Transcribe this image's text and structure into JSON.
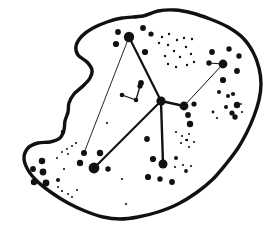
{
  "figure": {
    "canvas": {
      "width": 278,
      "height": 237,
      "background": "#ffffff",
      "ink": "#111111"
    },
    "outline": {
      "stroke_width": 3.4,
      "points": [
        [
          143,
          16
        ],
        [
          158,
          11
        ],
        [
          175,
          10
        ],
        [
          192,
          13
        ],
        [
          210,
          19
        ],
        [
          228,
          27
        ],
        [
          243,
          38
        ],
        [
          253,
          52
        ],
        [
          259,
          68
        ],
        [
          261,
          84
        ],
        [
          259,
          100
        ],
        [
          254,
          116
        ],
        [
          247,
          132
        ],
        [
          238,
          148
        ],
        [
          226,
          164
        ],
        [
          212,
          180
        ],
        [
          196,
          193
        ],
        [
          178,
          204
        ],
        [
          158,
          212
        ],
        [
          138,
          217
        ],
        [
          120,
          219
        ],
        [
          103,
          217
        ],
        [
          85,
          211
        ],
        [
          68,
          203
        ],
        [
          52,
          193
        ],
        [
          38,
          182
        ],
        [
          28,
          170
        ],
        [
          24,
          158
        ],
        [
          28,
          148
        ],
        [
          38,
          143
        ],
        [
          50,
          142
        ],
        [
          60,
          138
        ],
        [
          64,
          130
        ],
        [
          65,
          121
        ],
        [
          68,
          112
        ],
        [
          69,
          103
        ],
        [
          74,
          94
        ],
        [
          83,
          86
        ],
        [
          90,
          78
        ],
        [
          92,
          70
        ],
        [
          87,
          62
        ],
        [
          78,
          55
        ],
        [
          76,
          46
        ],
        [
          82,
          36
        ],
        [
          93,
          28
        ],
        [
          107,
          22
        ],
        [
          122,
          18
        ]
      ]
    },
    "edges": [
      {
        "x1": 129,
        "y1": 37,
        "x2": 161,
        "y2": 101,
        "w": 2.2
      },
      {
        "x1": 161,
        "y1": 101,
        "x2": 184,
        "y2": 106,
        "w": 2.4
      },
      {
        "x1": 161,
        "y1": 101,
        "x2": 163,
        "y2": 164,
        "w": 2.4
      },
      {
        "x1": 161,
        "y1": 101,
        "x2": 94,
        "y2": 168,
        "w": 2.2
      },
      {
        "x1": 184,
        "y1": 106,
        "x2": 223,
        "y2": 64,
        "w": 1.0
      },
      {
        "x1": 129,
        "y1": 37,
        "x2": 84,
        "y2": 153,
        "w": 0.9
      },
      {
        "x1": 223,
        "y1": 64,
        "x2": 209,
        "y2": 63,
        "w": 1.2
      },
      {
        "x1": 122,
        "y1": 95,
        "x2": 136,
        "y2": 100,
        "w": 1.3
      },
      {
        "x1": 140,
        "y1": 86,
        "x2": 136,
        "y2": 100,
        "w": 1.3
      }
    ],
    "hubs": [
      [
        129,
        37,
        5.2
      ],
      [
        223,
        64,
        4.4
      ],
      [
        161,
        101,
        4.6
      ],
      [
        184,
        106,
        4.4
      ],
      [
        94,
        168,
        5.4
      ],
      [
        163,
        164,
        4.5
      ]
    ],
    "dots": [
      [
        118,
        32,
        2.9
      ],
      [
        116,
        44,
        3.1
      ],
      [
        143,
        28,
        2.9
      ],
      [
        151,
        34,
        2.6
      ],
      [
        145,
        52,
        3.1
      ],
      [
        141,
        83,
        2.9
      ],
      [
        122,
        95,
        2.3
      ],
      [
        136,
        100,
        2.3
      ],
      [
        140,
        86,
        2.6
      ],
      [
        162,
        37,
        1.2
      ],
      [
        169,
        34,
        1.2
      ],
      [
        159,
        43,
        1.2
      ],
      [
        168,
        45,
        1.2
      ],
      [
        177,
        40,
        1.2
      ],
      [
        184,
        38,
        1.2
      ],
      [
        192,
        39,
        1.2
      ],
      [
        186,
        47,
        1.2
      ],
      [
        174,
        51,
        1.2
      ],
      [
        165,
        56,
        1.2
      ],
      [
        180,
        57,
        1.2
      ],
      [
        191,
        54,
        1.2
      ],
      [
        168,
        64,
        1.2
      ],
      [
        176,
        67,
        1.2
      ],
      [
        187,
        65,
        1.2
      ],
      [
        194,
        62,
        1.2
      ],
      [
        212,
        52,
        2.9
      ],
      [
        229,
        49,
        2.7
      ],
      [
        239,
        56,
        2.7
      ],
      [
        209,
        63,
        2.7
      ],
      [
        237,
        71,
        2.9
      ],
      [
        223,
        80,
        3.1
      ],
      [
        233,
        94,
        2.1
      ],
      [
        237,
        105,
        3.2
      ],
      [
        242,
        112,
        1.1
      ],
      [
        235,
        117,
        2.7
      ],
      [
        241,
        104,
        0.9
      ],
      [
        219,
        92,
        2.0
      ],
      [
        228,
        96,
        2.0
      ],
      [
        226,
        107,
        2.0
      ],
      [
        232,
        113,
        2.6
      ],
      [
        213,
        112,
        1.4
      ],
      [
        217,
        118,
        1.1
      ],
      [
        194,
        104,
        2.6
      ],
      [
        188,
        115,
        2.9
      ],
      [
        190,
        124,
        3.2
      ],
      [
        107,
        123,
        1.1
      ],
      [
        147,
        139,
        2.9
      ],
      [
        126,
        204,
        1.1
      ],
      [
        153,
        159,
        3.1
      ],
      [
        148,
        177,
        3.1
      ],
      [
        160,
        179,
        2.7
      ],
      [
        172,
        182,
        2.9
      ],
      [
        176,
        158,
        2.0
      ],
      [
        175,
        167,
        1.1
      ],
      [
        183,
        165,
        1.1
      ],
      [
        176,
        132,
        1.1
      ],
      [
        182,
        136,
        1.1
      ],
      [
        187,
        140,
        1.2
      ],
      [
        181,
        143,
        1.1
      ],
      [
        189,
        134,
        1.0
      ],
      [
        194,
        142,
        1.1
      ],
      [
        189,
        147,
        1.1
      ],
      [
        186,
        140,
        1.0
      ],
      [
        191,
        166,
        1.1
      ],
      [
        186,
        171,
        1.9
      ],
      [
        84,
        153,
        3.0
      ],
      [
        80,
        163,
        3.2
      ],
      [
        100,
        153,
        3.2
      ],
      [
        108,
        169,
        2.7
      ],
      [
        122,
        179,
        1.1
      ],
      [
        42,
        161,
        3.2
      ],
      [
        33,
        169,
        2.9
      ],
      [
        43,
        172,
        3.4
      ],
      [
        34,
        182,
        3.2
      ],
      [
        46,
        183,
        3.4
      ],
      [
        58,
        180,
        2.0
      ],
      [
        63,
        132,
        2.3
      ],
      [
        76,
        143,
        1.1
      ],
      [
        72,
        146,
        1.0
      ],
      [
        67,
        149,
        1.0
      ],
      [
        62,
        152,
        1.0
      ],
      [
        57,
        158,
        1.0
      ],
      [
        68,
        154,
        1.0
      ],
      [
        64,
        169,
        1.1
      ],
      [
        58,
        187,
        1.0
      ],
      [
        62,
        191,
        1.1
      ],
      [
        68,
        194,
        1.0
      ],
      [
        72,
        197,
        1.0
      ],
      [
        77,
        190,
        1.0
      ],
      [
        61,
        199,
        1.0
      ]
    ]
  }
}
